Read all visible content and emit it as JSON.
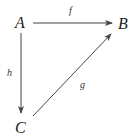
{
  "diagram": {
    "type": "commutative-diagram",
    "nodes": [
      {
        "id": "A",
        "label": "A",
        "x": 20,
        "y": 28
      },
      {
        "id": "B",
        "label": "B",
        "x": 123,
        "y": 29
      },
      {
        "id": "C",
        "label": "C",
        "x": 21,
        "y": 133
      }
    ],
    "edges": [
      {
        "from": "A",
        "to": "B",
        "label": "f"
      },
      {
        "from": "A",
        "to": "C",
        "label": "h"
      },
      {
        "from": "C",
        "to": "B",
        "label": "g"
      }
    ]
  }
}
